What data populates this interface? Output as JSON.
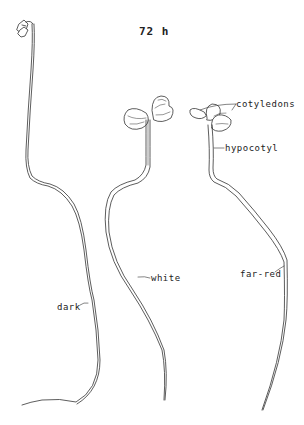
{
  "figure": {
    "title": "72 h",
    "labels": {
      "cotyledons": "cotyledons",
      "hypocotyl": "hypocotyl"
    },
    "seedlings": [
      {
        "condition": "dark",
        "label": "dark"
      },
      {
        "condition": "white",
        "label": "white"
      },
      {
        "condition": "far-red",
        "label": "far-red"
      }
    ],
    "colors": {
      "line": "#333333",
      "background": "#ffffff"
    }
  }
}
